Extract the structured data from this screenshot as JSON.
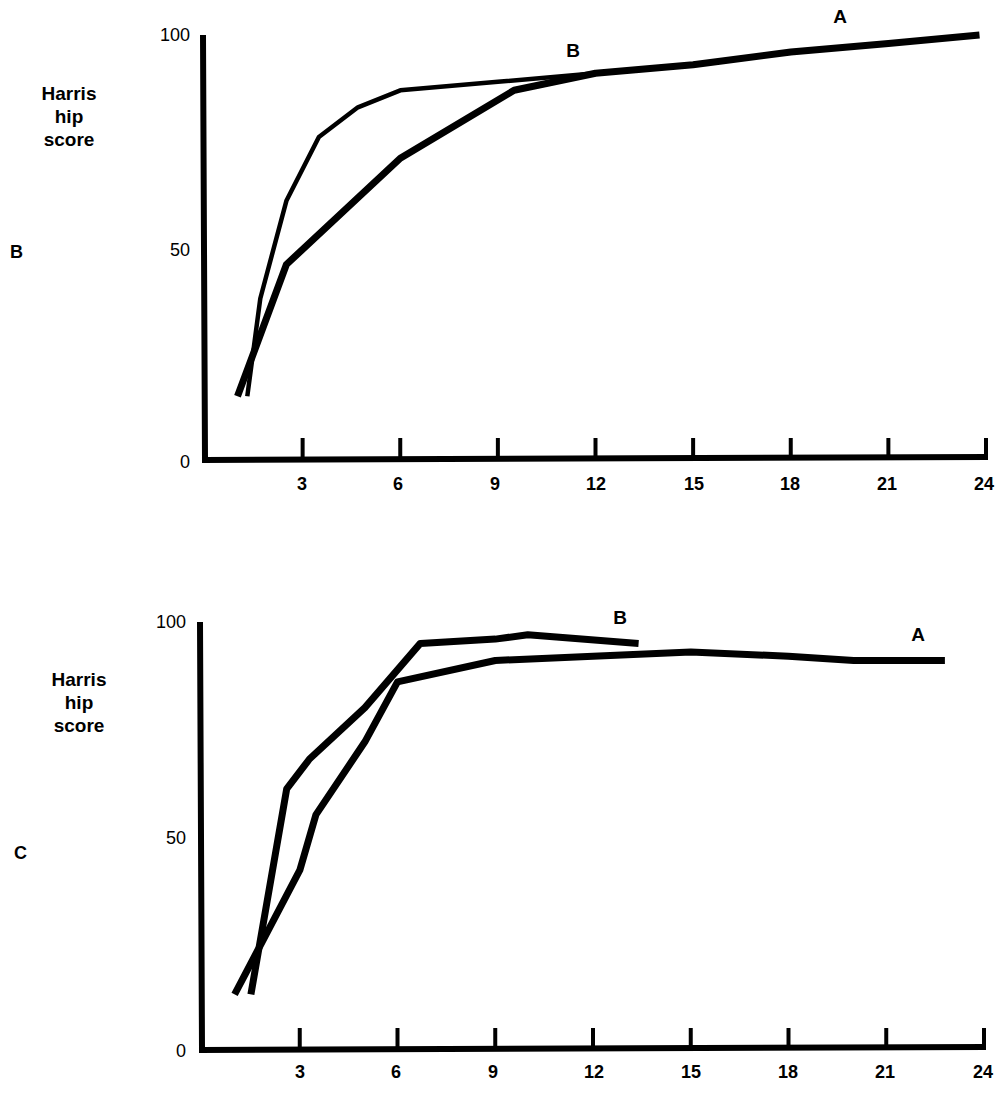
{
  "chart_data": [
    {
      "type": "line",
      "panel": "B",
      "title": "",
      "xlabel": "",
      "ylabel": "Harris hip score",
      "xticks": [
        3,
        6,
        9,
        12,
        15,
        18,
        21,
        24
      ],
      "yticks": [
        0,
        50,
        100
      ],
      "xlim": [
        0,
        24
      ],
      "ylim": [
        0,
        100
      ],
      "grid": false,
      "legend": "inline labels",
      "series": [
        {
          "name": "A",
          "style": "thick",
          "x": [
            1,
            2.5,
            6,
            9.5,
            12,
            15,
            18,
            21,
            23.8
          ],
          "y": [
            15,
            46,
            71,
            87,
            91,
            93,
            96,
            98,
            100
          ]
        },
        {
          "name": "B",
          "style": "thin",
          "x": [
            1.3,
            1.7,
            2.5,
            3.5,
            4.7,
            6,
            9,
            12
          ],
          "y": [
            15,
            38,
            61,
            76,
            83,
            87,
            89,
            91
          ]
        }
      ],
      "labels": {
        "panel": "B",
        "ylabel_lines": [
          "Harris",
          "hip",
          "score"
        ],
        "series_A": "A",
        "series_B": "B"
      }
    },
    {
      "type": "line",
      "panel": "C",
      "title": "",
      "xlabel": "",
      "ylabel": "Harris hip score",
      "xticks": [
        3,
        6,
        9,
        12,
        15,
        18,
        21,
        24
      ],
      "yticks": [
        0,
        50,
        100
      ],
      "xlim": [
        0,
        24
      ],
      "ylim": [
        0,
        100
      ],
      "grid": false,
      "legend": "inline labels",
      "series": [
        {
          "name": "A",
          "style": "thick",
          "x": [
            1,
            3,
            3.5,
            5,
            6,
            9,
            12,
            15,
            18,
            20,
            22.8
          ],
          "y": [
            13,
            42,
            55,
            72,
            86,
            91,
            92,
            93,
            92,
            91,
            91
          ]
        },
        {
          "name": "B",
          "style": "thick",
          "x": [
            1.5,
            2.6,
            3.3,
            5,
            6.7,
            9,
            10,
            13.4
          ],
          "y": [
            13,
            61,
            68,
            80,
            95,
            96,
            97,
            95
          ]
        }
      ],
      "labels": {
        "panel": "C",
        "ylabel_lines": [
          "Harris",
          "hip",
          "score"
        ],
        "series_A": "A",
        "series_B": "B"
      }
    }
  ],
  "panels": {
    "b": {
      "letter": "B",
      "ylabel": [
        "Harris",
        "hip",
        "score"
      ],
      "yticks": [
        "100",
        "50",
        "0"
      ],
      "xticks": [
        "3",
        "6",
        "9",
        "12",
        "15",
        "18",
        "21",
        "24"
      ],
      "series_a_label": "A",
      "series_b_label": "B"
    },
    "c": {
      "letter": "C",
      "ylabel": [
        "Harris",
        "hip",
        "score"
      ],
      "yticks": [
        "100",
        "50",
        "0"
      ],
      "xticks": [
        "3",
        "6",
        "9",
        "12",
        "15",
        "18",
        "21",
        "24"
      ],
      "series_a_label": "A",
      "series_b_label": "B"
    }
  }
}
